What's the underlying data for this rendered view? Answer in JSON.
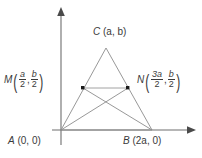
{
  "figure": {
    "background_color": "#ffffff",
    "line_color": "#8c8c8c",
    "axis_color": "#6e6e6e",
    "text_color": "#3a3a3a",
    "point_color": "#1a1a1a"
  },
  "axes": {
    "x_axis_name": "x-axis",
    "y_axis_name": "y-axis",
    "origin_x": 61,
    "origin_y": 130,
    "x_axis_end": 195,
    "y_axis_top": 8
  },
  "points": {
    "A": {
      "name": "A",
      "label_letter": "A",
      "coords_text": "(0, 0)",
      "x": 61,
      "y": 130
    },
    "B": {
      "name": "B",
      "label_letter": "B",
      "coords_text": "(2a, 0)",
      "x": 152,
      "y": 130
    },
    "C": {
      "name": "C",
      "label_letter": "C",
      "coords_text": "(a, b)",
      "x": 106,
      "y": 48
    },
    "M": {
      "name": "M",
      "label_letter": "M",
      "x": 83,
      "y": 88,
      "first_num": "a",
      "first_den": "2",
      "second_num": "b",
      "second_den": "2",
      "separator": ","
    },
    "N": {
      "name": "N",
      "label_letter": "N",
      "x": 128,
      "y": 88,
      "first_num": "3a",
      "first_den": "2",
      "second_num": "b",
      "second_den": "2",
      "separator": ","
    }
  },
  "segments": [
    {
      "name": "side-AC",
      "from": "A",
      "to": "C"
    },
    {
      "name": "side-BC",
      "from": "B",
      "to": "C"
    },
    {
      "name": "side-AB",
      "from": "A",
      "to": "B"
    },
    {
      "name": "segment-MN",
      "from": "M",
      "to": "N"
    },
    {
      "name": "cevian-AN",
      "from": "A",
      "to": "N"
    },
    {
      "name": "cevian-BM",
      "from": "B",
      "to": "M"
    }
  ],
  "brackets": {
    "open": "(",
    "close": ")"
  }
}
